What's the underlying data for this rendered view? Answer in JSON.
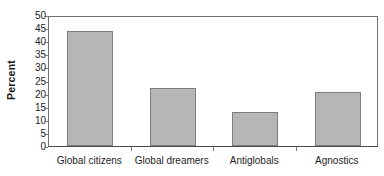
{
  "chart_data": {
    "type": "bar",
    "title": "",
    "xlabel": "",
    "ylabel": "Percent",
    "categories": [
      "Global citizens",
      "Global dreamers",
      "Antiglobals",
      "Agnostics"
    ],
    "values": [
      44,
      22,
      13,
      20.5
    ],
    "ylim": [
      0,
      50
    ],
    "ytick_step": 5,
    "yticks": [
      0,
      5,
      10,
      15,
      20,
      25,
      30,
      35,
      40,
      45,
      50
    ],
    "ytick_labels": [
      "0",
      "5",
      "10",
      "15",
      "20",
      "25",
      "30",
      "35",
      "40",
      "45",
      "50"
    ],
    "grid": false,
    "legend": null,
    "series": [
      {
        "name": "Percent",
        "values": [
          44,
          22,
          13,
          20.5
        ]
      }
    ],
    "colors": {
      "bar_fill": "#b6b6b6",
      "bar_border": "#7e7e7e",
      "axis": "#6e6e6e",
      "text": "#1c1c1c"
    }
  },
  "geometry": {
    "plot_left": 48,
    "plot_top": 16,
    "plot_width": 330,
    "plot_height": 131,
    "bar_width": 46,
    "slot_count": 4
  }
}
